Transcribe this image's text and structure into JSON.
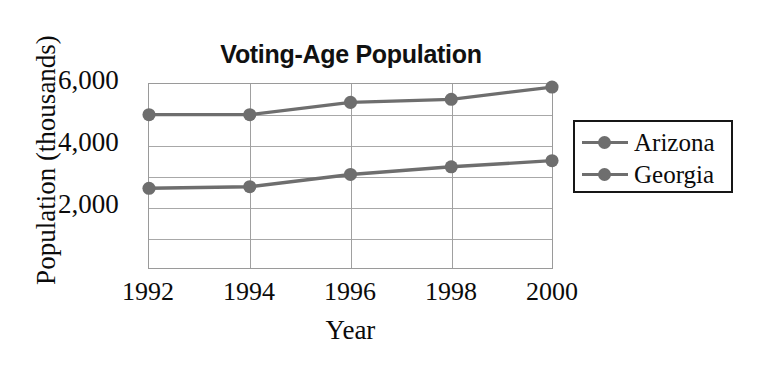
{
  "chart_data": {
    "type": "line",
    "title": "Voting-Age Population",
    "xlabel": "Year",
    "ylabel": "Population (thousands)",
    "categories": [
      1992,
      1994,
      1996,
      1998,
      2000
    ],
    "xtick_labels": [
      "1992",
      "1994",
      "1996",
      "1998",
      "2000"
    ],
    "ytick_labels": [
      "2,000",
      "4,000",
      "6,000"
    ],
    "ytick_values": [
      2000,
      4000,
      6000
    ],
    "gridline_values": [
      1000,
      2000,
      3000,
      4000,
      5000,
      6000
    ],
    "ylim": [
      0,
      6000
    ],
    "xlim": [
      1992,
      2000
    ],
    "grid": true,
    "legend_position": "right",
    "series": [
      {
        "name": "Arizona",
        "color": "#6e6e6e",
        "values": [
          2600,
          2650,
          3050,
          3300,
          3500
        ]
      },
      {
        "name": "Georgia",
        "color": "#6e6e6e",
        "values": [
          5000,
          5000,
          5400,
          5500,
          5900
        ]
      }
    ]
  },
  "legend": {
    "items": [
      {
        "label": "Arizona",
        "marker": "line-dot-marker"
      },
      {
        "label": "Georgia",
        "marker": "line-dot-marker"
      }
    ]
  },
  "colors": {
    "series": "#6e6e6e",
    "grid": "#a8a8a8",
    "axis": "#9a9a9a",
    "text": "#0b0b0b",
    "legend_border": "#171717",
    "background": "#ffffff"
  }
}
